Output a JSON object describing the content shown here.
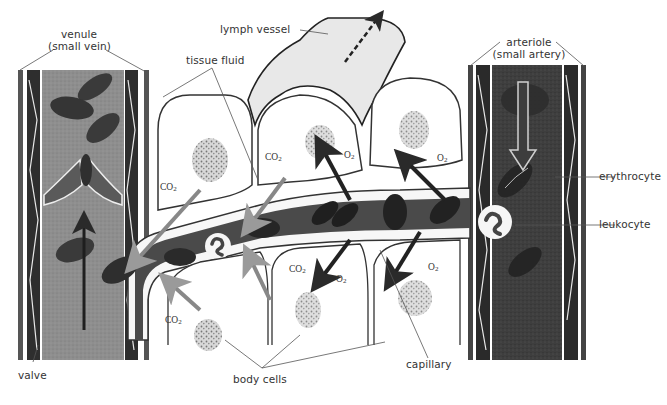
{
  "diagram": {
    "labels": {
      "venule": "venule",
      "venule_sub": "(small vein)",
      "lymph_vessel": "lymph vessel",
      "tissue_fluid": "tissue fluid",
      "arteriole": "arteriole",
      "arteriole_sub": "(small artery)",
      "erythrocyte": "erythrocyte",
      "leukocyte": "leukocyte",
      "capillary": "capillary",
      "body_cells": "body cells",
      "valve": "valve"
    },
    "gases": {
      "co2": "CO",
      "co2_sub": "2",
      "o2": "O",
      "o2_sub": "2"
    },
    "flow": {
      "arteriole_direction": "down",
      "venule_direction": "up",
      "lymph_direction": "up-right"
    },
    "colors": {
      "arteriole_blood": "#3a3a3a",
      "venule_blood": "#8c8c8c",
      "capillary_blood": "#4a4a4a",
      "lymph": "#e6e6e6",
      "cell_nucleus": "#9a9a9a",
      "background": "#ffffff"
    }
  }
}
